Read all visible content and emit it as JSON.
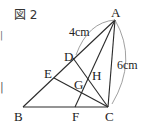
{
  "figure": {
    "title": "図 2",
    "points": {
      "A": "A",
      "B": "B",
      "C": "C",
      "D": "D",
      "E": "E",
      "F": "F",
      "G": "G",
      "H": "H"
    },
    "measures": {
      "AD": "4cm",
      "AC": "6cm"
    },
    "edge_marks": [
      "|",
      "|"
    ]
  }
}
